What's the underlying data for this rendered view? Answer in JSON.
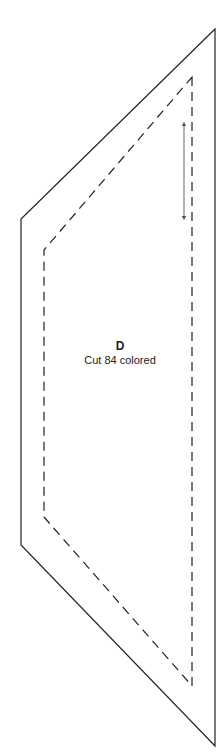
{
  "pattern": {
    "piece_letter": "D",
    "instruction": "Cut 84 colored",
    "colors": {
      "outline": "#222222",
      "seam_line": "#222222",
      "grain_arrow": "#555555",
      "background": "#ffffff"
    },
    "outer_cut_line": {
      "style": "solid",
      "points": [
        [
          215,
          29
        ],
        [
          215,
          746
        ],
        [
          21,
          545
        ],
        [
          21,
          219
        ]
      ]
    },
    "inner_seam_line": {
      "style": "dashed",
      "points": [
        [
          192,
          77
        ],
        [
          192,
          686
        ],
        [
          44,
          517
        ],
        [
          44,
          250
        ]
      ]
    },
    "grain_arrow": {
      "x": 184,
      "y_start": 122,
      "y_end": 220,
      "direction": "double-headed"
    }
  }
}
